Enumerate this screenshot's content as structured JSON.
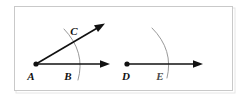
{
  "figure": {
    "background_color": "#ffffff",
    "panel": {
      "border_color": "#c9c9c9",
      "fill_color": "#ffffff",
      "x": 14,
      "y": 6,
      "width": 219,
      "height": 85
    },
    "ink_color": "#111111",
    "arc_color": "#8d8d8d"
  },
  "diagram_left": {
    "name": "angle-bac",
    "vertex": {
      "label": "A",
      "x": 36,
      "y": 64
    },
    "rays": [
      {
        "name": "ray-ab",
        "label": "B",
        "label_x": 67,
        "label_y": 78,
        "from_x": 36,
        "from_y": 64,
        "to_x": 110,
        "to_y": 64,
        "direction": "horizontal-right",
        "arrowhead": true
      },
      {
        "name": "ray-ac",
        "label": "C",
        "label_x": 73,
        "label_y": 34,
        "from_x": 36,
        "from_y": 64,
        "to_x": 104,
        "to_y": 24,
        "direction": "diagonal-up-right",
        "arrowhead": true
      }
    ],
    "arc": {
      "name": "angle-arc-left",
      "start_x": 64,
      "start_y": 29,
      "end_x": 78,
      "end_y": 80,
      "control_x": 86,
      "control_y": 52
    }
  },
  "diagram_right": {
    "name": "ray-de",
    "vertex": {
      "label": "D",
      "x": 127,
      "y": 64
    },
    "rays": [
      {
        "name": "ray-de",
        "label": "E",
        "label_x": 159,
        "label_y": 78,
        "from_x": 127,
        "from_y": 64,
        "to_x": 203,
        "to_y": 64,
        "direction": "horizontal-right",
        "arrowhead": true
      }
    ],
    "arc": {
      "name": "angle-arc-right",
      "start_x": 152,
      "start_y": 28,
      "end_x": 167,
      "end_y": 77,
      "control_x": 174,
      "control_y": 50
    }
  },
  "labels": {
    "A": "A",
    "B": "B",
    "C": "C",
    "D": "D",
    "E": "E"
  }
}
